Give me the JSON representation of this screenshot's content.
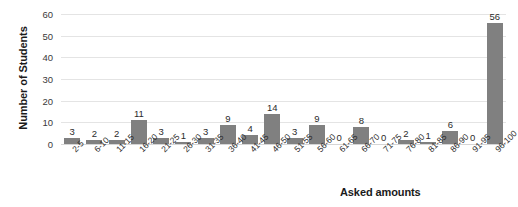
{
  "chart_data": {
    "type": "bar",
    "title": "",
    "xlabel": "Asked amounts",
    "ylabel": "Number of Students",
    "categories": [
      "2-5",
      "6-10",
      "11-15",
      "16-20",
      "21-25",
      "26-30",
      "31-35",
      "36-40",
      "41-45",
      "46-50",
      "51-55",
      "56-60",
      "61-65",
      "66-70",
      "71-75",
      "76-80",
      "81-85",
      "86-90",
      "91-95",
      "96-100"
    ],
    "values": [
      3,
      2,
      2,
      11,
      3,
      1,
      3,
      9,
      4,
      14,
      3,
      9,
      0,
      8,
      0,
      2,
      1,
      6,
      0,
      56
    ],
    "data_labels": [
      "3",
      "2",
      "2",
      "11",
      "3",
      "1",
      "3",
      "9",
      "4",
      "14",
      "3",
      "9",
      "0",
      "8",
      "0",
      "2",
      "1",
      "6",
      "0",
      "56"
    ],
    "ylim": [
      0,
      60
    ],
    "y_ticks": [
      0,
      10,
      20,
      30,
      40,
      50,
      60
    ],
    "y_tick_labels": [
      "0",
      "10",
      "20",
      "30",
      "40",
      "50",
      "60"
    ],
    "grid": true,
    "legend": "none",
    "bar_color": "#808080",
    "gridline_color": "#e4e4e4",
    "text_color": "#1a1a1a"
  }
}
